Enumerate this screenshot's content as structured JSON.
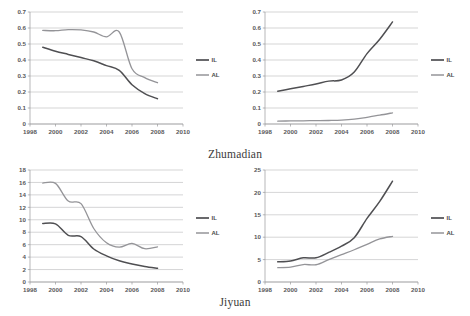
{
  "figure": {
    "captions": {
      "top": "Zhumadian",
      "bottom": "Jiyuan"
    },
    "colors": {
      "il_line": "#4f4f52",
      "al_line": "#949498",
      "gridline": "#b9b9bb",
      "axis": "#9a9a9c",
      "background": "#ffffff"
    }
  },
  "chart_data": [
    {
      "type": "line",
      "panel": "top-left",
      "title": "",
      "xlabel": "",
      "ylabel": "",
      "xlim": [
        1998,
        2010
      ],
      "ylim": [
        0,
        0.7
      ],
      "grid": true,
      "legend_position": "right",
      "xticks": [
        "1998",
        "2000",
        "2002",
        "2004",
        "2006",
        "2008",
        "2010"
      ],
      "yticks": [
        "0",
        "0.1",
        "0.2",
        "0.3",
        "0.4",
        "0.5",
        "0.6",
        "0.7"
      ],
      "x": [
        1999,
        2000,
        2001,
        2002,
        2003,
        2004,
        2005,
        2006,
        2007,
        2008
      ],
      "series": [
        {
          "name": "IL",
          "values": [
            0.48,
            0.455,
            0.435,
            0.415,
            0.395,
            0.365,
            0.335,
            0.245,
            0.19,
            0.158
          ]
        },
        {
          "name": "AL",
          "values": [
            0.585,
            0.583,
            0.59,
            0.588,
            0.575,
            0.545,
            0.575,
            0.345,
            0.29,
            0.258
          ]
        }
      ]
    },
    {
      "type": "line",
      "panel": "top-right",
      "title": "",
      "xlabel": "",
      "ylabel": "",
      "xlim": [
        1998,
        2010
      ],
      "ylim": [
        0,
        0.7
      ],
      "grid": true,
      "legend_position": "right",
      "xticks": [
        "1998",
        "2000",
        "2002",
        "2004",
        "2006",
        "2008",
        "2010"
      ],
      "yticks": [
        "0",
        "0.1",
        "0.2",
        "0.3",
        "0.4",
        "0.5",
        "0.6",
        "0.7"
      ],
      "x": [
        1999,
        2000,
        2001,
        2002,
        2003,
        2004,
        2005,
        2006,
        2007,
        2008
      ],
      "series": [
        {
          "name": "IL",
          "values": [
            0.205,
            0.22,
            0.235,
            0.25,
            0.268,
            0.275,
            0.325,
            0.44,
            0.53,
            0.638
          ]
        },
        {
          "name": "AL",
          "values": [
            0.018,
            0.019,
            0.02,
            0.021,
            0.022,
            0.024,
            0.03,
            0.042,
            0.055,
            0.07
          ]
        }
      ]
    },
    {
      "type": "line",
      "panel": "bottom-left",
      "title": "",
      "xlabel": "",
      "ylabel": "",
      "xlim": [
        1998,
        2010
      ],
      "ylim": [
        0,
        18
      ],
      "grid": true,
      "legend_position": "right",
      "xticks": [
        "1998",
        "2000",
        "2002",
        "2004",
        "2006",
        "2008",
        "2010"
      ],
      "yticks": [
        "0",
        "2",
        "4",
        "6",
        "8",
        "10",
        "12",
        "14",
        "16",
        "18"
      ],
      "x": [
        1999,
        2000,
        2001,
        2002,
        2003,
        2004,
        2005,
        2006,
        2007,
        2008
      ],
      "series": [
        {
          "name": "IL",
          "values": [
            9.4,
            9.35,
            7.5,
            7.3,
            5.3,
            4.2,
            3.4,
            2.9,
            2.5,
            2.2
          ]
        },
        {
          "name": "AL",
          "values": [
            15.9,
            15.85,
            13.0,
            12.6,
            8.6,
            6.3,
            5.6,
            6.2,
            5.35,
            5.65
          ]
        }
      ]
    },
    {
      "type": "line",
      "panel": "bottom-right",
      "title": "",
      "xlabel": "",
      "ylabel": "",
      "xlim": [
        1998,
        2010
      ],
      "ylim": [
        0,
        25
      ],
      "grid": true,
      "legend_position": "right",
      "xticks": [
        "1998",
        "2000",
        "2002",
        "2004",
        "2006",
        "2008",
        "2010"
      ],
      "yticks": [
        "0",
        "5",
        "10",
        "15",
        "20",
        "25"
      ],
      "x": [
        1999,
        2000,
        2001,
        2002,
        2003,
        2004,
        2005,
        2006,
        2007,
        2008
      ],
      "series": [
        {
          "name": "IL",
          "values": [
            4.5,
            4.7,
            5.4,
            5.4,
            6.6,
            8.0,
            9.9,
            14.2,
            18.0,
            22.5
          ]
        },
        {
          "name": "AL",
          "values": [
            3.2,
            3.3,
            3.9,
            3.85,
            5.0,
            6.1,
            7.2,
            8.4,
            9.6,
            10.2
          ]
        }
      ]
    }
  ]
}
